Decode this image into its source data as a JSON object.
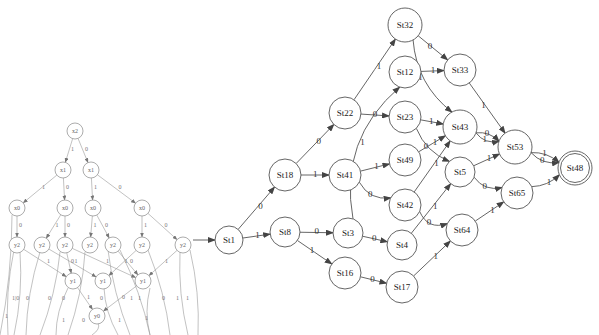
{
  "automaton": {
    "start_state": "St1",
    "accept_states": [
      "St48"
    ],
    "states": [
      "St1",
      "St18",
      "St8",
      "St22",
      "St41",
      "St3",
      "St16",
      "St32",
      "St12",
      "St23",
      "St49",
      "St42",
      "St4",
      "St17",
      "St33",
      "St43",
      "St5",
      "St64",
      "St53",
      "St65",
      "St48"
    ],
    "transitions": [
      {
        "from": "St1",
        "to": "St18",
        "label": "0"
      },
      {
        "from": "St1",
        "to": "St8",
        "label": "1"
      },
      {
        "from": "St18",
        "to": "St22",
        "label": "0"
      },
      {
        "from": "St18",
        "to": "St41",
        "label": "1"
      },
      {
        "from": "St8",
        "to": "St3",
        "label": "0"
      },
      {
        "from": "St8",
        "to": "St16",
        "label": "1"
      },
      {
        "from": "St22",
        "to": "St32",
        "label": "1"
      },
      {
        "from": "St22",
        "to": "St23",
        "label": "0"
      },
      {
        "from": "St41",
        "to": "St49",
        "label": "1"
      },
      {
        "from": "St41",
        "to": "St42",
        "label": "0"
      },
      {
        "from": "St3",
        "to": "St12",
        "label": "1"
      },
      {
        "from": "St3",
        "to": "St4",
        "label": "0"
      },
      {
        "from": "St16",
        "to": "St17",
        "label": "0"
      },
      {
        "from": "St32",
        "to": "St33",
        "label": "0"
      },
      {
        "from": "St32",
        "to": "St43",
        "label": "1"
      },
      {
        "from": "St12",
        "to": "St33",
        "label": "1"
      },
      {
        "from": "St23",
        "to": "St43",
        "label": "1"
      },
      {
        "from": "St23",
        "to": "St5",
        "label": "0"
      },
      {
        "from": "St49",
        "to": "St43",
        "label": "1"
      },
      {
        "from": "St42",
        "to": "St43",
        "label": "1"
      },
      {
        "from": "St42",
        "to": "St64",
        "label": "0"
      },
      {
        "from": "St4",
        "to": "St5",
        "label": "1"
      },
      {
        "from": "St17",
        "to": "St64",
        "label": "1"
      },
      {
        "from": "St33",
        "to": "St53",
        "label": "1"
      },
      {
        "from": "St43",
        "to": "St53",
        "label": "0"
      },
      {
        "from": "St43",
        "to": "St53",
        "label": "1"
      },
      {
        "from": "St5",
        "to": "St53",
        "label": "1"
      },
      {
        "from": "St5",
        "to": "St65",
        "label": "0"
      },
      {
        "from": "St64",
        "to": "St65",
        "label": "1"
      },
      {
        "from": "St53",
        "to": "St48",
        "label": "1"
      },
      {
        "from": "St53",
        "to": "St48",
        "label": "0"
      },
      {
        "from": "St65",
        "to": "St48",
        "label": "1"
      }
    ]
  },
  "bdd": {
    "nodes": [
      {
        "id": "b_x2",
        "label": "x2"
      },
      {
        "id": "b_x1a",
        "label": "x1"
      },
      {
        "id": "b_x1b",
        "label": "x1"
      },
      {
        "id": "b_x0a",
        "label": "x0"
      },
      {
        "id": "b_x0b",
        "label": "x0"
      },
      {
        "id": "b_x0c",
        "label": "x0"
      },
      {
        "id": "b_x0d",
        "label": "x0"
      },
      {
        "id": "b_y2a",
        "label": "y2"
      },
      {
        "id": "b_y2b",
        "label": "y2"
      },
      {
        "id": "b_y2c",
        "label": "y2"
      },
      {
        "id": "b_y2d",
        "label": "y2"
      },
      {
        "id": "b_y2e",
        "label": "y2"
      },
      {
        "id": "b_y2f",
        "label": "y2"
      },
      {
        "id": "b_y2g",
        "label": "y2"
      },
      {
        "id": "b_y1a",
        "label": "y1"
      },
      {
        "id": "b_y1b",
        "label": "y1"
      },
      {
        "id": "b_y1c",
        "label": "y1"
      },
      {
        "id": "b_y0",
        "label": "y0"
      }
    ],
    "edges": [
      {
        "from": "b_x2",
        "to": "b_x1a",
        "label": "1"
      },
      {
        "from": "b_x2",
        "to": "b_x1b",
        "label": "0"
      },
      {
        "from": "b_x1a",
        "to": "b_x0a",
        "label": "1"
      },
      {
        "from": "b_x1a",
        "to": "b_x0b",
        "label": "0"
      },
      {
        "from": "b_x1b",
        "to": "b_x0c",
        "label": "1"
      },
      {
        "from": "b_x1b",
        "to": "b_x0d",
        "label": "0"
      },
      {
        "from": "b_x0a",
        "to": "b_y2a",
        "label": "0"
      },
      {
        "from": "b_x0b",
        "to": "b_y2b",
        "label": "1"
      },
      {
        "from": "b_x0b",
        "to": "b_y2c",
        "label": "0"
      },
      {
        "from": "b_x0c",
        "to": "b_y2d",
        "label": "1"
      },
      {
        "from": "b_x0c",
        "to": "b_y2e",
        "label": "0"
      },
      {
        "from": "b_x0d",
        "to": "b_y2f",
        "label": "1"
      },
      {
        "from": "b_x0d",
        "to": "b_y2g",
        "label": "0"
      },
      {
        "from": "b_y2a",
        "to": "b_y1a",
        "label": "1"
      },
      {
        "from": "b_y2b",
        "to": "b_y1b",
        "label": "1"
      },
      {
        "from": "b_y2c",
        "to": "b_y1a",
        "label": "0"
      },
      {
        "from": "b_y2c",
        "to": "b_y1c",
        "label": "1"
      },
      {
        "from": "b_y2e",
        "to": "b_y1c",
        "label": "0"
      },
      {
        "from": "b_y2f",
        "to": "b_y1b",
        "label": "1"
      },
      {
        "from": "b_y2g",
        "to": "b_y1c",
        "label": "1"
      },
      {
        "from": "b_y1a",
        "to": "b_y0",
        "label": "1"
      },
      {
        "from": "b_y1c",
        "to": "b_y0",
        "label": "0"
      }
    ],
    "dangling_labels": [
      "1",
      "1|0",
      "0",
      "0",
      "0",
      "0",
      "0",
      "1",
      "1",
      "0",
      "1",
      "1",
      "1",
      "1",
      "1"
    ]
  }
}
